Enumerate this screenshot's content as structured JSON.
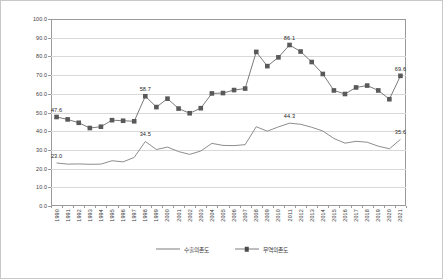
{
  "chart_data": {
    "type": "line",
    "title": "",
    "subtitle": "",
    "xlabel": "",
    "ylabel": "",
    "ylim": [
      0.0,
      100.0
    ],
    "ytick_step": 10.0,
    "grid": true,
    "legend_position": "bottom",
    "ytick_labels": [
      "0.0",
      "10.0",
      "20.0",
      "30.0",
      "40.0",
      "50.0",
      "60.0",
      "70.0",
      "80.0",
      "90.0",
      "100.0"
    ],
    "categories": [
      "1990",
      "1991",
      "1992",
      "1993",
      "1994",
      "1995",
      "1996",
      "1997",
      "1998",
      "1999",
      "2000",
      "2001",
      "2002",
      "2003",
      "2004",
      "2005",
      "2006",
      "2007",
      "2008",
      "2009",
      "2010",
      "2011",
      "2012",
      "2013",
      "2014",
      "2015",
      "2016",
      "2017",
      "2018",
      "2019",
      "2020",
      "2021"
    ],
    "series": [
      {
        "name": "수출의존도",
        "style": "line",
        "color": "#808080",
        "marker": "none",
        "values": [
          23.0,
          22.4,
          22.5,
          22.3,
          22.4,
          24.2,
          23.6,
          26.0,
          34.5,
          30.2,
          31.5,
          29.1,
          27.6,
          29.4,
          33.5,
          32.4,
          32.3,
          32.8,
          42.4,
          40.0,
          42.3,
          44.3,
          43.7,
          42.1,
          40.1,
          36.1,
          33.6,
          34.6,
          34.1,
          32.0,
          30.6,
          35.6
        ]
      },
      {
        "name": "무역의존도",
        "style": "line-marker",
        "color": "#595959",
        "marker": "square",
        "values": [
          47.6,
          46.3,
          44.5,
          41.7,
          42.4,
          45.9,
          45.6,
          45.3,
          58.7,
          52.9,
          57.4,
          52.1,
          49.6,
          52.3,
          60.2,
          60.4,
          62.0,
          62.8,
          82.4,
          74.8,
          79.5,
          86.1,
          82.6,
          77.0,
          70.6,
          61.8,
          59.9,
          63.4,
          64.4,
          61.8,
          57.1,
          69.6
        ]
      }
    ],
    "annotations": [
      {
        "series": "무역의존도",
        "category": "1990",
        "value": 47.6,
        "text": "47.6"
      },
      {
        "series": "무역의존도",
        "category": "1998",
        "value": 58.7,
        "text": "58.7"
      },
      {
        "series": "무역의존도",
        "category": "2011",
        "value": 86.1,
        "text": "86.1"
      },
      {
        "series": "무역의존도",
        "category": "2021",
        "value": 69.6,
        "text": "69.6"
      },
      {
        "series": "수출의존도",
        "category": "1990",
        "value": 23.0,
        "text": "23.0"
      },
      {
        "series": "수출의존도",
        "category": "1998",
        "value": 34.5,
        "text": "34.5"
      },
      {
        "series": "수출의존도",
        "category": "2011",
        "value": 44.3,
        "text": "44.3"
      },
      {
        "series": "수출의존도",
        "category": "2021",
        "value": 35.6,
        "text": "35.6"
      }
    ]
  },
  "legend": {
    "items": [
      {
        "label": "수출의존도",
        "marker": "none"
      },
      {
        "label": "무역의존도",
        "marker": "square"
      }
    ]
  }
}
